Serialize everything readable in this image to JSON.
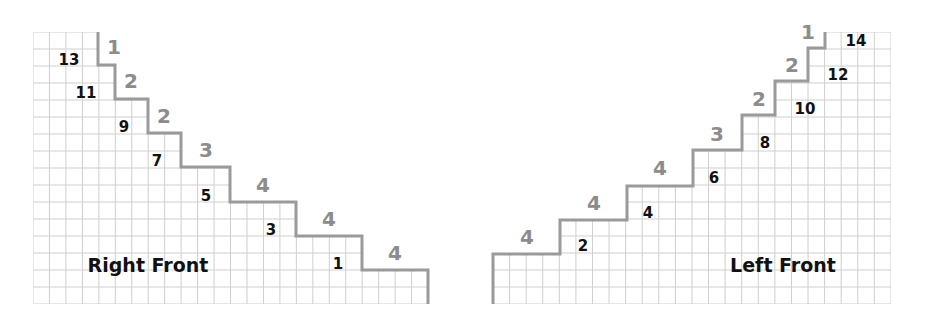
{
  "colors": {
    "grid": "#cfcfcf",
    "staircase": "#9a9a9a",
    "step_label": "#8c8c8c",
    "row_label": "#111111"
  },
  "right_front": {
    "title": "Right Front",
    "grid": {
      "x": 33,
      "y": 32,
      "cols": 24,
      "rows": 16,
      "cell_w": 16.46,
      "cell_h": 17
    },
    "staircase_points": [
      [
        98,
        32
      ],
      [
        98,
        65
      ],
      [
        115,
        65
      ],
      [
        115,
        99
      ],
      [
        148,
        99
      ],
      [
        148,
        133
      ],
      [
        181,
        133
      ],
      [
        181,
        167
      ],
      [
        230,
        167
      ],
      [
        230,
        202
      ],
      [
        296,
        202
      ],
      [
        296,
        236
      ],
      [
        362,
        236
      ],
      [
        362,
        270
      ],
      [
        428,
        270
      ],
      [
        428,
        304
      ]
    ],
    "step_labels": [
      {
        "text": "1",
        "x": 114,
        "y": 47
      },
      {
        "text": "2",
        "x": 131,
        "y": 81
      },
      {
        "text": "2",
        "x": 164,
        "y": 116
      },
      {
        "text": "3",
        "x": 206,
        "y": 150
      },
      {
        "text": "4",
        "x": 263,
        "y": 185
      },
      {
        "text": "4",
        "x": 329,
        "y": 219
      },
      {
        "text": "4",
        "x": 395,
        "y": 253
      }
    ],
    "row_labels": [
      {
        "text": "13",
        "x": 69,
        "y": 60
      },
      {
        "text": "11",
        "x": 86,
        "y": 93
      },
      {
        "text": "9",
        "x": 124,
        "y": 127
      },
      {
        "text": "7",
        "x": 157,
        "y": 161
      },
      {
        "text": "5",
        "x": 206,
        "y": 196
      },
      {
        "text": "3",
        "x": 271,
        "y": 230
      },
      {
        "text": "1",
        "x": 338,
        "y": 264
      }
    ],
    "title_pos": {
      "x": 148,
      "y": 265
    }
  },
  "left_front": {
    "title": "Left Front",
    "grid": {
      "x": 493,
      "y": 32,
      "cols": 24,
      "rows": 16,
      "cell_w": 16.58,
      "cell_h": 17
    },
    "staircase_points": [
      [
        493,
        304
      ],
      [
        493,
        254
      ],
      [
        560,
        254
      ],
      [
        560,
        220
      ],
      [
        627,
        220
      ],
      [
        627,
        186
      ],
      [
        693,
        186
      ],
      [
        693,
        150
      ],
      [
        742,
        150
      ],
      [
        742,
        115
      ],
      [
        775,
        115
      ],
      [
        775,
        81
      ],
      [
        808,
        81
      ],
      [
        808,
        48
      ],
      [
        825,
        48
      ],
      [
        825,
        32
      ]
    ],
    "step_labels": [
      {
        "text": "4",
        "x": 527,
        "y": 237
      },
      {
        "text": "4",
        "x": 594,
        "y": 203
      },
      {
        "text": "4",
        "x": 660,
        "y": 168
      },
      {
        "text": "3",
        "x": 717,
        "y": 134
      },
      {
        "text": "2",
        "x": 759,
        "y": 99
      },
      {
        "text": "2",
        "x": 792,
        "y": 65
      },
      {
        "text": "1",
        "x": 808,
        "y": 32
      }
    ],
    "row_labels": [
      {
        "text": "2",
        "x": 583,
        "y": 246
      },
      {
        "text": "4",
        "x": 648,
        "y": 213
      },
      {
        "text": "6",
        "x": 714,
        "y": 178
      },
      {
        "text": "8",
        "x": 765,
        "y": 143
      },
      {
        "text": "10",
        "x": 805,
        "y": 109
      },
      {
        "text": "12",
        "x": 838,
        "y": 75
      },
      {
        "text": "14",
        "x": 856,
        "y": 41
      }
    ],
    "title_pos": {
      "x": 783,
      "y": 265
    }
  }
}
